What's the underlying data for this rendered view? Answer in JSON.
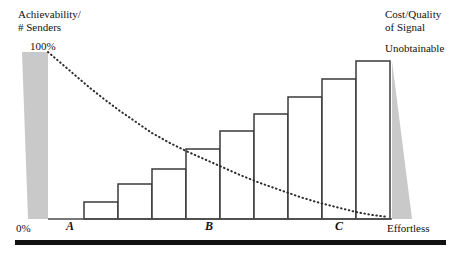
{
  "figure": {
    "axis_labels": {
      "y_left_line1": "Achievability/",
      "y_left_line2": "# Senders",
      "y_left_max": "100%",
      "y_left_min": "0%",
      "y_right_line1": "Cost/Quality",
      "y_right_line2": "of Signal",
      "right_top": "Unobtainable",
      "right_bottom": "Effortless"
    },
    "x_ticks": [
      {
        "label": "A",
        "x": 66
      },
      {
        "label": "B",
        "x": 205
      },
      {
        "label": "C",
        "x": 335
      }
    ],
    "colors": {
      "bar_stroke": "#3a3a3a",
      "bar_fill": "#ffffff",
      "shade_grey": "#c9c9c9",
      "curve": "#2b2b2b",
      "baseline": "#4a4a4a",
      "ground_bar": "#111111",
      "text": "#111111"
    }
  },
  "chart_data": {
    "type": "bar",
    "title": "",
    "xlabel": "",
    "ylabel": "",
    "categories": [
      "1",
      "2",
      "3",
      "4",
      "5",
      "6",
      "7",
      "8",
      "9"
    ],
    "values": [
      17,
      35,
      50,
      70,
      88,
      105,
      122,
      140,
      158
    ],
    "ylim": [
      0,
      168
    ],
    "grid": false,
    "legend": null,
    "bar_geometry": {
      "baseline_y": 219,
      "left_x": 50,
      "bar_width": 34,
      "starts": [
        84,
        118,
        152,
        186,
        220,
        254,
        288,
        322,
        356
      ],
      "tops": [
        202,
        184,
        169,
        149,
        131,
        114,
        97,
        79,
        61
      ]
    },
    "overlay_curve": {
      "name": "Achievability / # Senders",
      "style": "dotted",
      "points": [
        [
          48,
          52
        ],
        [
          62,
          64
        ],
        [
          76,
          76
        ],
        [
          90,
          88
        ],
        [
          104,
          99
        ],
        [
          120,
          111
        ],
        [
          136,
          122
        ],
        [
          152,
          133
        ],
        [
          168,
          142
        ],
        [
          186,
          151
        ],
        [
          204,
          159
        ],
        [
          222,
          167
        ],
        [
          240,
          175
        ],
        [
          260,
          183
        ],
        [
          280,
          190
        ],
        [
          300,
          197
        ],
        [
          320,
          203
        ],
        [
          340,
          208
        ],
        [
          356,
          212
        ],
        [
          372,
          215
        ],
        [
          388,
          217
        ]
      ]
    },
    "shaded_regions": [
      {
        "name": "achievability-wedge",
        "fill": "#c9c9c9",
        "polygon": "22,52 48,52 48,219 28,219"
      },
      {
        "name": "unobtainable-wedge",
        "fill": "#c9c9c9",
        "polygon": "392,61 412,219 392,219"
      }
    ],
    "ground_bar": {
      "x1": 15,
      "x2": 446,
      "y": 243,
      "thickness": 5
    }
  }
}
